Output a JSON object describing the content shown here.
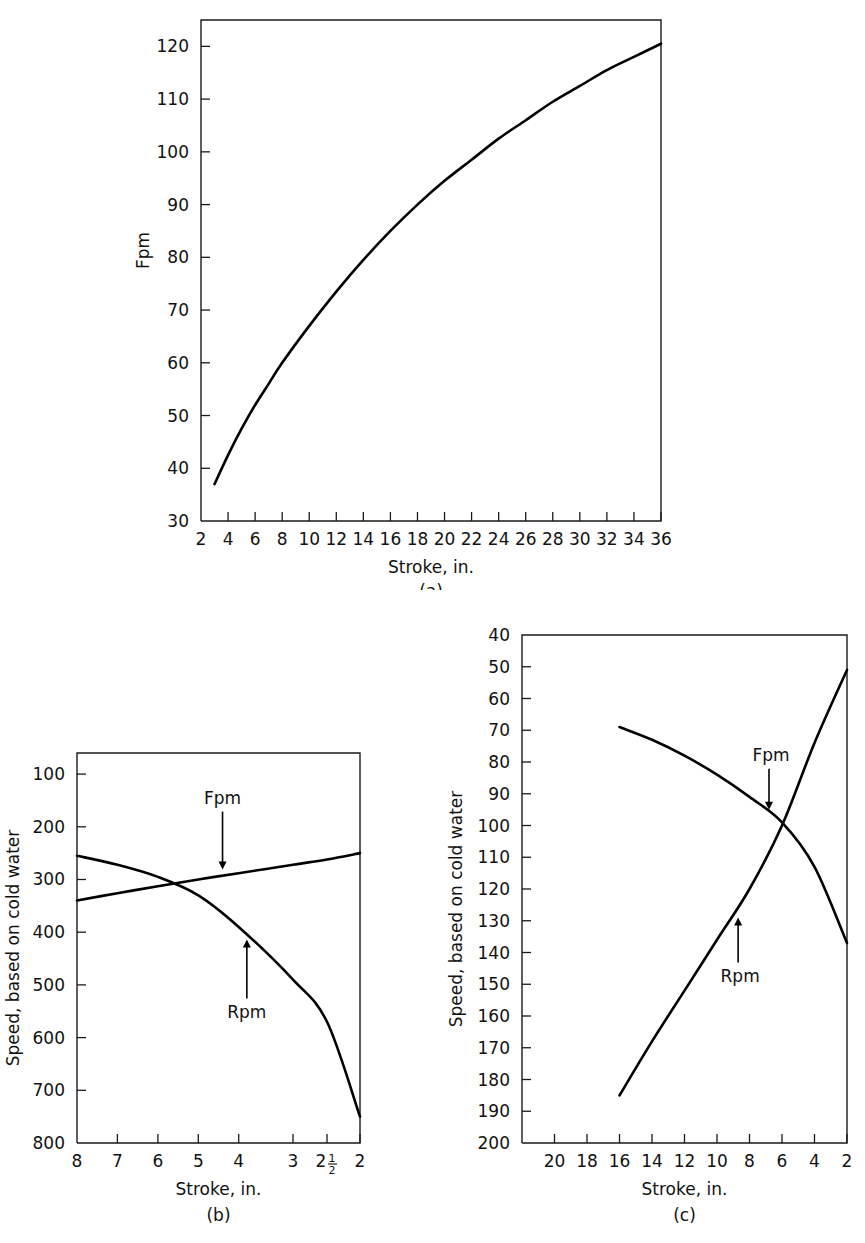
{
  "figure": {
    "panels": [
      {
        "caption": "(a)",
        "xlabel": "Stroke, in.",
        "ylabel": "Fpm",
        "xticks": [
          "2",
          "4",
          "6",
          "8",
          "10",
          "12",
          "14",
          "16",
          "18",
          "20",
          "22",
          "24",
          "26",
          "28",
          "30",
          "32",
          "34",
          "36"
        ],
        "yticks": [
          "30",
          "40",
          "50",
          "60",
          "70",
          "80",
          "90",
          "100",
          "110",
          "120"
        ],
        "series_labels": []
      },
      {
        "caption": "(b)",
        "xlabel": "Stroke, in.",
        "ylabel": "Speed, based on cold water",
        "xticks": [
          "8",
          "7",
          "6",
          "5",
          "4",
          "3",
          "2½",
          "2"
        ],
        "yticks": [
          "100",
          "200",
          "300",
          "400",
          "500",
          "600",
          "700",
          "800"
        ],
        "series_labels": [
          "Fpm",
          "Rpm"
        ]
      },
      {
        "caption": "(c)",
        "xlabel": "Stroke, in.",
        "ylabel": "Speed, based on cold water",
        "xticks": [
          "20",
          "18",
          "16",
          "14",
          "12",
          "10",
          "8",
          "6",
          "4",
          "2"
        ],
        "yticks": [
          "40",
          "50",
          "60",
          "70",
          "80",
          "90",
          "100",
          "110",
          "120",
          "130",
          "140",
          "150",
          "160",
          "170",
          "180",
          "190",
          "200"
        ],
        "series_labels": [
          "Fpm",
          "Rpm"
        ]
      }
    ]
  },
  "chart_data": [
    {
      "id": "panel-a",
      "type": "line",
      "title": "",
      "caption": "(a)",
      "xlabel": "Stroke, in.",
      "ylabel": "Fpm",
      "xlim": [
        2,
        36
      ],
      "ylim": [
        30,
        125
      ],
      "y_axis_inverted": false,
      "grid": false,
      "legend": "none",
      "xticks": [
        2,
        4,
        6,
        8,
        10,
        12,
        14,
        16,
        18,
        20,
        22,
        24,
        26,
        28,
        30,
        32,
        34,
        36
      ],
      "yticks": [
        30,
        40,
        50,
        60,
        70,
        80,
        90,
        100,
        110,
        120
      ],
      "series": [
        {
          "name": "Fpm",
          "x": [
            3,
            4,
            5,
            6,
            7,
            8,
            10,
            12,
            14,
            16,
            18,
            20,
            22,
            24,
            26,
            28,
            30,
            32,
            34,
            36
          ],
          "values": [
            37,
            42.5,
            47.5,
            52,
            56,
            60,
            67,
            73.5,
            79.5,
            85,
            90,
            94.5,
            98.5,
            102.5,
            106,
            109.5,
            112.5,
            115.5,
            118,
            120.5
          ]
        }
      ]
    },
    {
      "id": "panel-b",
      "type": "line",
      "caption": "(b)",
      "xlabel": "Stroke, in.",
      "ylabel": "Speed, based on cold water",
      "xlim": [
        8,
        2
      ],
      "ylim": [
        60,
        800
      ],
      "y_axis_inverted": true,
      "x_axis_reversed": true,
      "grid": false,
      "legend": "inline-annotations",
      "xticks": [
        8,
        7,
        6,
        5,
        4,
        3,
        2.5,
        2
      ],
      "xtick_labels": [
        "8",
        "7",
        "6",
        "5",
        "4",
        "3",
        "2½",
        "2"
      ],
      "yticks": [
        100,
        200,
        300,
        400,
        500,
        600,
        700,
        800
      ],
      "series": [
        {
          "name": "Fpm",
          "x": [
            8,
            7,
            6,
            5,
            4,
            3,
            2.5,
            2
          ],
          "values": [
            340,
            326,
            313,
            300,
            288,
            272,
            262,
            250
          ]
        },
        {
          "name": "Rpm",
          "x": [
            8,
            7,
            6,
            5,
            4,
            3,
            2.5,
            2
          ],
          "values": [
            255,
            272,
            295,
            330,
            390,
            490,
            570,
            750
          ]
        }
      ]
    },
    {
      "id": "panel-c",
      "type": "line",
      "caption": "(c)",
      "xlabel": "Stroke, in.",
      "ylabel": "Speed, based on cold water",
      "xlim": [
        22,
        2
      ],
      "ylim": [
        40,
        200
      ],
      "y_axis_inverted": true,
      "x_axis_reversed": true,
      "grid": false,
      "legend": "inline-annotations",
      "xticks": [
        20,
        18,
        16,
        14,
        12,
        10,
        8,
        6,
        4,
        2
      ],
      "yticks": [
        40,
        50,
        60,
        70,
        80,
        90,
        100,
        110,
        120,
        130,
        140,
        150,
        160,
        170,
        180,
        190,
        200
      ],
      "series": [
        {
          "name": "Fpm",
          "x": [
            16,
            14,
            12,
            10,
            8,
            6,
            4,
            2
          ],
          "values": [
            69,
            73,
            78,
            84,
            91,
            99,
            113,
            137
          ]
        },
        {
          "name": "Rpm",
          "x": [
            16,
            14,
            12,
            10,
            8,
            6,
            4,
            2
          ],
          "values": [
            185,
            168,
            152,
            136,
            120,
            100,
            74,
            51
          ]
        }
      ]
    }
  ]
}
